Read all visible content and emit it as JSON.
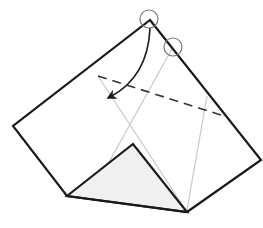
{
  "diagram": {
    "type": "origami-fold-step",
    "colors": {
      "outline": "#1a1a1a",
      "guide_line": "#c8c8c8",
      "shaded_flap": "#f0f0f0",
      "marker_circle": "#777777",
      "background": "#ffffff"
    },
    "paper_outline": [
      [
        150,
        20
      ],
      [
        261,
        160
      ],
      [
        187,
        212
      ],
      [
        67,
        196
      ],
      [
        13,
        126
      ]
    ],
    "folded_flap": [
      [
        67,
        196
      ],
      [
        133,
        144
      ],
      [
        187,
        212
      ]
    ],
    "valley_fold_line": {
      "from": [
        98,
        76
      ],
      "to": [
        224,
        116
      ]
    },
    "guide_lines": [
      {
        "from": [
          98,
          76
        ],
        "to": [
          187,
          212
        ]
      },
      {
        "from": [
          173,
          47
        ],
        "to": [
          88,
          200
        ]
      },
      {
        "from": [
          207,
          96
        ],
        "to": [
          187,
          210
        ]
      }
    ],
    "marker_circles": [
      {
        "cx": 149,
        "cy": 19,
        "r": 9,
        "label": "reference-point-apex"
      },
      {
        "cx": 173,
        "cy": 47,
        "r": 9,
        "label": "reference-point-target"
      }
    ],
    "fold_arrow": {
      "from": [
        150,
        28
      ],
      "to": [
        110,
        97
      ],
      "direction": "down-left"
    }
  }
}
